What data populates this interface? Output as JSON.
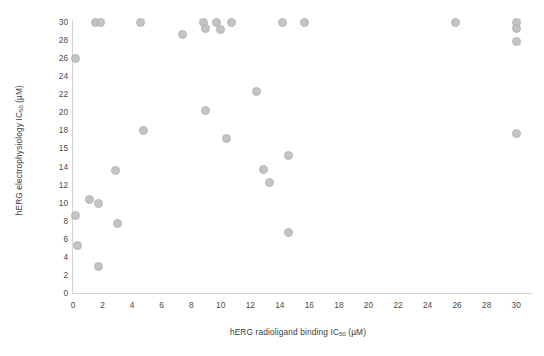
{
  "chart_data": {
    "type": "scatter",
    "title": "",
    "xlabel": "hERG radioligand binding IC50 (µM)",
    "xlabel_prefix": "hERG radioligand binding IC",
    "xlabel_sub": "50",
    "xlabel_suffix": " (µM)",
    "ylabel": "hERG electrophysiology IC50 (µM)",
    "ylabel_prefix": "hERG electrophysiology IC",
    "ylabel_sub": "50",
    "ylabel_suffix": " (µM)",
    "xlim": [
      0,
      31
    ],
    "ylim": [
      0,
      30
    ],
    "grid": false,
    "legend": false,
    "marker_color": "#bfbfbf",
    "marker_edge_color": "#b2b2b2",
    "axis_color": "#d4d4d4",
    "text_color": "#4a4a4a",
    "xticks": [
      0,
      2,
      4,
      6,
      8,
      10,
      12,
      14,
      16,
      18,
      20,
      22,
      24,
      26,
      28,
      30
    ],
    "yticks": [
      0,
      2,
      4,
      6,
      8,
      10,
      12,
      14,
      15,
      18,
      20,
      22,
      24,
      26,
      28,
      30
    ],
    "ytick_labels": [
      "30",
      "28",
      "26",
      "24",
      "22",
      "20",
      "18",
      "15",
      "14",
      "12",
      "10",
      "8",
      "6",
      "4",
      "2",
      "0"
    ],
    "points": [
      {
        "x": 0.2,
        "y": 26.0
      },
      {
        "x": 0.2,
        "y": 8.6
      },
      {
        "x": 0.3,
        "y": 5.3
      },
      {
        "x": 1.1,
        "y": 10.4
      },
      {
        "x": 1.55,
        "y": 30.0
      },
      {
        "x": 1.85,
        "y": 30.0
      },
      {
        "x": 1.7,
        "y": 9.9
      },
      {
        "x": 1.75,
        "y": 2.9
      },
      {
        "x": 2.9,
        "y": 13.6
      },
      {
        "x": 3.0,
        "y": 7.7
      },
      {
        "x": 4.6,
        "y": 30.0
      },
      {
        "x": 4.75,
        "y": 18.0
      },
      {
        "x": 7.4,
        "y": 28.6
      },
      {
        "x": 8.8,
        "y": 30.0
      },
      {
        "x": 9.0,
        "y": 29.3
      },
      {
        "x": 8.95,
        "y": 20.2
      },
      {
        "x": 9.7,
        "y": 30.0
      },
      {
        "x": 10.0,
        "y": 29.2
      },
      {
        "x": 10.7,
        "y": 30.0
      },
      {
        "x": 10.4,
        "y": 16.7
      },
      {
        "x": 12.4,
        "y": 22.3
      },
      {
        "x": 12.9,
        "y": 13.7
      },
      {
        "x": 13.3,
        "y": 12.2
      },
      {
        "x": 14.2,
        "y": 30.0
      },
      {
        "x": 14.6,
        "y": 14.6
      },
      {
        "x": 14.6,
        "y": 6.7
      },
      {
        "x": 15.7,
        "y": 30.0
      },
      {
        "x": 25.9,
        "y": 30.0
      },
      {
        "x": 30.0,
        "y": 30.0
      },
      {
        "x": 30.0,
        "y": 29.3
      },
      {
        "x": 30.0,
        "y": 27.8
      },
      {
        "x": 30.0,
        "y": 17.5
      }
    ]
  }
}
